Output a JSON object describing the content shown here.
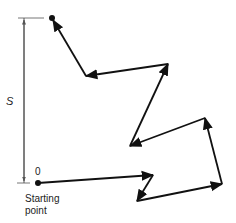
{
  "diagram": {
    "displacement_label": "S",
    "start_label": "0",
    "starting_point_label_line1": "Starting",
    "starting_point_label_line2": "point",
    "colors": {
      "path": "#111111",
      "dimension": "#555555",
      "text": "#222222"
    },
    "path_points": [
      [
        38,
        183
      ],
      [
        153,
        175
      ],
      [
        137,
        201
      ],
      [
        222,
        184
      ],
      [
        205,
        118
      ],
      [
        130,
        146
      ],
      [
        168,
        64
      ],
      [
        86,
        76
      ],
      [
        52,
        18
      ]
    ]
  }
}
